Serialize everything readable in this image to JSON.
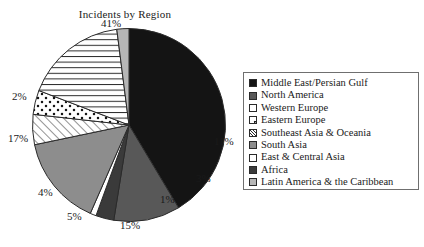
{
  "chart_data": {
    "type": "pie",
    "title": "Incidents by Region",
    "xlabel": "",
    "ylabel": "",
    "legend_position": "right",
    "grid": false,
    "units": "percent",
    "categories": [
      "Middle East/Persian Gulf",
      "North America",
      "Western Europe",
      "Eastern Europe",
      "Southeast Asia & Oceania",
      "South Asia",
      "East & Central Asia",
      "Africa",
      "Latin America & the Caribbean"
    ],
    "values": [
      41,
      11,
      4,
      1,
      5,
      15,
      17,
      3,
      2
    ],
    "slices": [
      {
        "label": "Middle East/Persian Gulf",
        "value": 41,
        "value_text": "41%",
        "fill": "#141414",
        "pattern": "solid",
        "swatch": "solid-black"
      },
      {
        "label": "North America",
        "value": 11,
        "value_text": "11%",
        "fill": "#585858",
        "pattern": "solid",
        "swatch": "solid-gray"
      },
      {
        "label": "Africa",
        "value": 3,
        "value_text": "3%",
        "fill": "#3a3a3a",
        "pattern": "solid",
        "swatch": "solid-darkgray"
      },
      {
        "label": "Eastern Europe",
        "value": 1,
        "value_text": "1%",
        "fill": "#ffffff",
        "pattern": "solid",
        "swatch": "white-dot"
      },
      {
        "label": "South Asia",
        "value": 15,
        "value_text": "15%",
        "fill": "#8d8d8d",
        "pattern": "solid",
        "swatch": "solid-midgray"
      },
      {
        "label": "Southeast Asia & Oceania",
        "value": 5,
        "value_text": "5%",
        "fill": "#ffffff",
        "pattern": "diagonal-hatch",
        "swatch": "diagonal-hatch"
      },
      {
        "label": "Western Europe",
        "value": 4,
        "value_text": "4%",
        "fill": "#ffffff",
        "pattern": "dotted",
        "swatch": "white"
      },
      {
        "label": "East & Central Asia",
        "value": 17,
        "value_text": "17%",
        "fill": "#ffffff",
        "pattern": "horizontal-hatch",
        "swatch": "white"
      },
      {
        "label": "Latin America & the Caribbean",
        "value": 2,
        "value_text": "2%",
        "fill": "#b6b6b6",
        "pattern": "solid",
        "swatch": "solid-lightgray"
      }
    ]
  },
  "legend": {
    "items": [
      {
        "label": "Middle East/Persian Gulf",
        "swatch": "solid-black"
      },
      {
        "label": "North America",
        "swatch": "solid-gray"
      },
      {
        "label": "Western Europe",
        "swatch": "white"
      },
      {
        "label": "Eastern Europe",
        "swatch": "white-dot"
      },
      {
        "label": "Southeast Asia & Oceania",
        "swatch": "diagonal-hatch"
      },
      {
        "label": "South Asia",
        "swatch": "solid-midgray"
      },
      {
        "label": "East & Central Asia",
        "swatch": "white"
      },
      {
        "label": "Africa",
        "swatch": "solid-darkgray"
      },
      {
        "label": "Latin America & the Caribbean",
        "swatch": "solid-lightgray"
      }
    ]
  },
  "labels": [
    {
      "text": "41%",
      "x": 101,
      "y": 17,
      "name": "pie-label-middle-east"
    },
    {
      "text": "11%",
      "x": 214,
      "y": 135,
      "name": "pie-label-north-america"
    },
    {
      "text": "3%",
      "x": 196,
      "y": 172,
      "name": "pie-label-africa"
    },
    {
      "text": "1%",
      "x": 160,
      "y": 193,
      "name": "pie-label-eastern-europe"
    },
    {
      "text": "15%",
      "x": 120,
      "y": 219,
      "name": "pie-label-south-asia"
    },
    {
      "text": "5%",
      "x": 67,
      "y": 210,
      "name": "pie-label-southeast-asia"
    },
    {
      "text": "4%",
      "x": 38,
      "y": 186,
      "name": "pie-label-western-europe"
    },
    {
      "text": "17%",
      "x": 8,
      "y": 132,
      "name": "pie-label-east-central"
    },
    {
      "text": "2%",
      "x": 12,
      "y": 90,
      "name": "pie-label-latin-america"
    }
  ],
  "colors": {
    "black": "#141414",
    "dark_gray": "#3a3a3a",
    "gray": "#585858",
    "mid_gray": "#8d8d8d",
    "light_gray": "#b6b6b6",
    "white": "#ffffff",
    "outline": "#2a2a2a",
    "legend_border": "#6f6f6f"
  }
}
